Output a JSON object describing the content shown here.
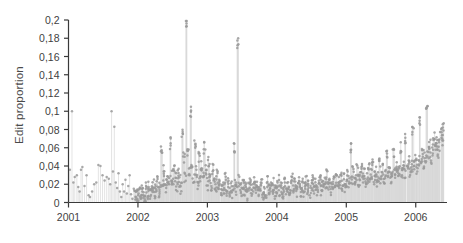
{
  "chart_data": {
    "type": "scatter",
    "title": "",
    "subtitle": "",
    "xlabel": "",
    "ylabel": "Edit proportion",
    "xlim": [
      2001.0,
      2006.45
    ],
    "ylim": [
      0,
      0.2
    ],
    "grid": false,
    "legend": null,
    "marker_color": "#9a9a9a",
    "stem_color": "#d8d8d8",
    "axis_color": "#3a3a3a",
    "decimal_separator": ",",
    "x_ticks": [
      2001,
      2002,
      2003,
      2004,
      2005,
      2006
    ],
    "x_tick_labels": [
      "2001",
      "2002",
      "2003",
      "2004",
      "2005",
      "2006"
    ],
    "y_ticks": [
      0,
      0.02,
      0.04,
      0.06,
      0.08,
      0.1,
      0.12,
      0.14,
      0.16,
      0.18,
      0.2
    ],
    "y_tick_labels": [
      "0",
      "0,02",
      "0,04",
      "0,06",
      "0,08",
      "0,1",
      "0,12",
      "0,14",
      "0,16",
      "0,18",
      "0,2"
    ],
    "series": [
      {
        "name": "Edit proportion",
        "style": "stem-scatter",
        "x": [
          2001.02,
          2001.05,
          2001.07,
          2001.09,
          2001.12,
          2001.14,
          2001.16,
          2001.18,
          2001.2,
          2001.23,
          2001.26,
          2001.29,
          2001.31,
          2001.34,
          2001.37,
          2001.4,
          2001.43,
          2001.46,
          2001.49,
          2001.52,
          2001.55,
          2001.58,
          2001.6,
          2001.62,
          2001.64,
          2001.66,
          2001.68,
          2001.7,
          2001.72,
          2001.74,
          2001.76,
          2001.78,
          2001.8,
          2001.82,
          2001.84,
          2001.86,
          2001.88,
          2001.9,
          2001.92,
          2001.94,
          2001.96,
          2001.98,
          2002.0,
          2002.02,
          2002.04,
          2002.06,
          2002.08,
          2002.1,
          2002.12,
          2002.14,
          2002.16,
          2002.18,
          2002.2,
          2002.22,
          2002.24,
          2002.26,
          2002.28,
          2002.3,
          2002.32,
          2002.34,
          2002.36,
          2002.38,
          2002.4,
          2002.42,
          2002.44,
          2002.46,
          2002.48,
          2002.5,
          2002.52,
          2002.54,
          2002.56,
          2002.58,
          2002.6,
          2002.62,
          2002.64,
          2002.66,
          2002.68,
          2002.7,
          2002.72,
          2002.74,
          2002.76,
          2002.78,
          2002.8,
          2002.82,
          2002.84,
          2002.86,
          2002.88,
          2002.9,
          2002.92,
          2002.94,
          2002.96,
          2002.98,
          2003.0,
          2003.02,
          2003.04,
          2003.06,
          2003.08,
          2003.1,
          2003.12,
          2003.14,
          2003.16,
          2003.18,
          2003.2,
          2003.22,
          2003.24,
          2003.26,
          2003.28,
          2003.3,
          2003.32,
          2003.34,
          2003.36,
          2003.38,
          2003.4,
          2003.42,
          2003.44,
          2003.46,
          2003.48,
          2003.5,
          2003.52,
          2003.54,
          2003.56,
          2003.58,
          2003.6,
          2003.62,
          2003.64,
          2003.66,
          2003.68,
          2003.7,
          2003.72,
          2003.74,
          2003.76,
          2003.78,
          2003.8,
          2003.82,
          2003.84,
          2003.86,
          2003.88,
          2003.9,
          2003.92,
          2003.94,
          2003.96,
          2003.98,
          2004.0,
          2004.02,
          2004.04,
          2004.06,
          2004.08,
          2004.1,
          2004.12,
          2004.14,
          2004.16,
          2004.18,
          2004.2,
          2004.22,
          2004.24,
          2004.26,
          2004.28,
          2004.3,
          2004.32,
          2004.34,
          2004.36,
          2004.38,
          2004.4,
          2004.42,
          2004.44,
          2004.46,
          2004.48,
          2004.5,
          2004.52,
          2004.54,
          2004.56,
          2004.58,
          2004.6,
          2004.62,
          2004.64,
          2004.66,
          2004.68,
          2004.7,
          2004.72,
          2004.74,
          2004.76,
          2004.78,
          2004.8,
          2004.82,
          2004.84,
          2004.86,
          2004.88,
          2004.9,
          2004.92,
          2004.94,
          2004.96,
          2004.98,
          2005.0,
          2005.02,
          2005.04,
          2005.06,
          2005.08,
          2005.1,
          2005.12,
          2005.14,
          2005.16,
          2005.18,
          2005.2,
          2005.22,
          2005.24,
          2005.26,
          2005.28,
          2005.3,
          2005.32,
          2005.34,
          2005.36,
          2005.38,
          2005.4,
          2005.42,
          2005.44,
          2005.46,
          2005.48,
          2005.5,
          2005.52,
          2005.54,
          2005.56,
          2005.58,
          2005.6,
          2005.62,
          2005.64,
          2005.66,
          2005.68,
          2005.7,
          2005.72,
          2005.74,
          2005.76,
          2005.78,
          2005.8,
          2005.82,
          2005.84,
          2005.86,
          2005.88,
          2005.9,
          2005.92,
          2005.94,
          2005.96,
          2005.98,
          2006.0,
          2006.02,
          2006.04,
          2006.06,
          2006.08,
          2006.1,
          2006.12,
          2006.14,
          2006.16,
          2006.18,
          2006.2,
          2006.22,
          2006.24,
          2006.26,
          2006.28,
          2006.3,
          2006.32,
          2006.34,
          2006.36,
          2006.38,
          2006.4
        ],
        "y": [
          0.036,
          0.1,
          0.022,
          0.028,
          0.03,
          0.017,
          0.012,
          0.036,
          0.039,
          0.018,
          0.03,
          0.008,
          0.006,
          0.012,
          0.02,
          0.022,
          0.041,
          0.04,
          0.03,
          0.024,
          0.028,
          0.026,
          0.02,
          0.1,
          0.034,
          0.083,
          0.022,
          0.016,
          0.032,
          0.012,
          0.006,
          0.02,
          0.012,
          0.025,
          0.01,
          0.018,
          0.03,
          0.009,
          0.004,
          0.015,
          0.006,
          0.01,
          0.008,
          0.012,
          0.007,
          0.014,
          0.011,
          0.005,
          0.018,
          0.01,
          0.016,
          0.008,
          0.012,
          0.02,
          0.01,
          0.015,
          0.022,
          0.012,
          0.018,
          0.06,
          0.025,
          0.034,
          0.016,
          0.028,
          0.02,
          0.065,
          0.03,
          0.022,
          0.04,
          0.026,
          0.018,
          0.033,
          0.024,
          0.015,
          0.075,
          0.048,
          0.029,
          0.198,
          0.052,
          0.036,
          0.1,
          0.045,
          0.027,
          0.062,
          0.033,
          0.02,
          0.05,
          0.03,
          0.042,
          0.026,
          0.06,
          0.035,
          0.02,
          0.045,
          0.028,
          0.018,
          0.036,
          0.022,
          0.014,
          0.03,
          0.018,
          0.025,
          0.012,
          0.02,
          0.016,
          0.028,
          0.014,
          0.022,
          0.01,
          0.018,
          0.012,
          0.06,
          0.02,
          0.014,
          0.175,
          0.024,
          0.016,
          0.01,
          0.02,
          0.013,
          0.018,
          0.009,
          0.015,
          0.02,
          0.011,
          0.016,
          0.022,
          0.012,
          0.018,
          0.01,
          0.014,
          0.02,
          0.008,
          0.016,
          0.012,
          0.022,
          0.015,
          0.01,
          0.018,
          0.013,
          0.02,
          0.011,
          0.016,
          0.024,
          0.012,
          0.018,
          0.01,
          0.015,
          0.022,
          0.013,
          0.019,
          0.011,
          0.016,
          0.028,
          0.014,
          0.02,
          0.012,
          0.017,
          0.024,
          0.013,
          0.019,
          0.01,
          0.016,
          0.022,
          0.014,
          0.02,
          0.012,
          0.018,
          0.026,
          0.015,
          0.021,
          0.013,
          0.018,
          0.024,
          0.014,
          0.02,
          0.016,
          0.022,
          0.03,
          0.017,
          0.023,
          0.015,
          0.02,
          0.026,
          0.018,
          0.024,
          0.016,
          0.022,
          0.028,
          0.019,
          0.025,
          0.017,
          0.023,
          0.03,
          0.02,
          0.06,
          0.026,
          0.034,
          0.022,
          0.028,
          0.036,
          0.024,
          0.03,
          0.04,
          0.026,
          0.032,
          0.022,
          0.028,
          0.038,
          0.025,
          0.031,
          0.042,
          0.027,
          0.034,
          0.024,
          0.03,
          0.045,
          0.028,
          0.036,
          0.026,
          0.032,
          0.05,
          0.03,
          0.038,
          0.028,
          0.035,
          0.055,
          0.032,
          0.04,
          0.03,
          0.036,
          0.06,
          0.034,
          0.042,
          0.032,
          0.07,
          0.038,
          0.046,
          0.034,
          0.04,
          0.08,
          0.042,
          0.05,
          0.038,
          0.045,
          0.09,
          0.048,
          0.056,
          0.042,
          0.05,
          0.105,
          0.055,
          0.062,
          0.048,
          0.058,
          0.07,
          0.06,
          0.066,
          0.055,
          0.062,
          0.075,
          0.068,
          0.08
        ]
      }
    ],
    "annotations": [
      {
        "label": "peak",
        "x": 2002.7,
        "y": 0.198
      },
      {
        "label": "peak",
        "x": 2003.44,
        "y": 0.175
      }
    ]
  }
}
